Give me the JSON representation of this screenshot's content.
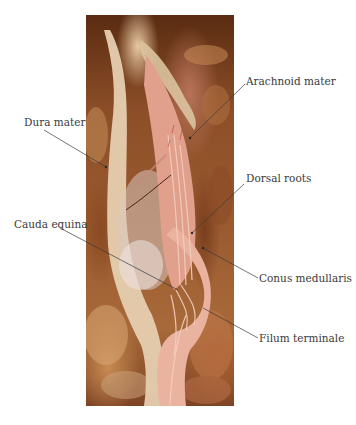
{
  "figure": {
    "labels": [
      {
        "id": "arachnoid-mater",
        "text": "Arachnoid mater",
        "side": "right"
      },
      {
        "id": "dura-mater",
        "text": "Dura mater",
        "side": "left"
      },
      {
        "id": "dorsal-roots",
        "text": "Dorsal roots",
        "side": "right"
      },
      {
        "id": "cauda-equina",
        "text": "Cauda equina",
        "side": "left"
      },
      {
        "id": "conus-medullaris",
        "text": "Conus medullaris",
        "side": "right"
      },
      {
        "id": "filum-terminale",
        "text": "Filum terminale",
        "side": "right"
      }
    ],
    "colors": {
      "background": "#ffffff",
      "label_text": "#3a3a3a",
      "leader_line": "#3a3a3a",
      "tissue_pink": "#e3a58f",
      "dura_pale": "#e6cfb0",
      "surrounding_tissue": "#9a5b30"
    }
  }
}
